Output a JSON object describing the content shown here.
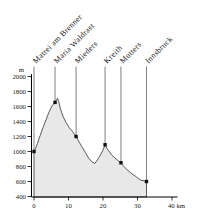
{
  "chart_data": {
    "type": "area",
    "title": "",
    "xlabel": "km",
    "ylabel": "m",
    "xlim": [
      0,
      40
    ],
    "ylim": [
      400,
      2000
    ],
    "grid": false,
    "x_ticks": [
      {
        "value": 0,
        "label": "0"
      },
      {
        "value": 10,
        "label": "10"
      },
      {
        "value": 20,
        "label": "20"
      },
      {
        "value": 30,
        "label": "30"
      },
      {
        "value": 40,
        "label": "40 km"
      }
    ],
    "y_ticks": [
      {
        "value": 400,
        "label": "400"
      },
      {
        "value": 600,
        "label": "600"
      },
      {
        "value": 800,
        "label": "800"
      },
      {
        "value": 1000,
        "label": "1000"
      },
      {
        "value": 1200,
        "label": "1200"
      },
      {
        "value": 1400,
        "label": "1400"
      },
      {
        "value": 1600,
        "label": "1600"
      },
      {
        "value": 1800,
        "label": "1800"
      },
      {
        "value": 2000,
        "label": "2000"
      }
    ],
    "y_unit_label": "m",
    "profile_km_m": [
      [
        0,
        1000
      ],
      [
        0.5,
        1045
      ],
      [
        1,
        1110
      ],
      [
        1.8,
        1215
      ],
      [
        2.6,
        1320
      ],
      [
        3.5,
        1425
      ],
      [
        4.3,
        1520
      ],
      [
        5.2,
        1605
      ],
      [
        6.1,
        1655
      ],
      [
        6.8,
        1710
      ],
      [
        7.2,
        1665
      ],
      [
        7.6,
        1580
      ],
      [
        8.4,
        1470
      ],
      [
        9.3,
        1385
      ],
      [
        10.2,
        1320
      ],
      [
        11.2,
        1265
      ],
      [
        12.2,
        1200
      ],
      [
        13.1,
        1125
      ],
      [
        14,
        1055
      ],
      [
        14.9,
        985
      ],
      [
        15.8,
        915
      ],
      [
        16.7,
        865
      ],
      [
        17.6,
        840
      ],
      [
        18.4,
        890
      ],
      [
        19.2,
        950
      ],
      [
        20,
        1020
      ],
      [
        20.6,
        1090
      ],
      [
        21.4,
        1025
      ],
      [
        22.6,
        950
      ],
      [
        23.8,
        900
      ],
      [
        25.2,
        850
      ],
      [
        26.1,
        800
      ],
      [
        27,
        755
      ],
      [
        27.9,
        720
      ],
      [
        28.8,
        690
      ],
      [
        29.7,
        660
      ],
      [
        30.4,
        635
      ],
      [
        31,
        618
      ],
      [
        31.9,
        608
      ],
      [
        32.6,
        600
      ]
    ],
    "locations": [
      {
        "name": "Matrei am Brenner",
        "km": 0,
        "elevation": 1000
      },
      {
        "name": "Maria Waldrast",
        "km": 6.1,
        "elevation": 1655
      },
      {
        "name": "Mieders",
        "km": 12.2,
        "elevation": 1200
      },
      {
        "name": "Kreith",
        "km": 20.6,
        "elevation": 1090
      },
      {
        "name": "Mutters",
        "km": 25.2,
        "elevation": 850
      },
      {
        "name": "Innsbruck",
        "km": 32.6,
        "elevation": 600
      }
    ],
    "colors": {
      "area_fill": "#e8e8e8",
      "curve_stroke": "#333333",
      "axis": "#000000",
      "guide_line": "#4a4a4a",
      "marker": "#111111",
      "text": "#1a1a1a"
    }
  }
}
